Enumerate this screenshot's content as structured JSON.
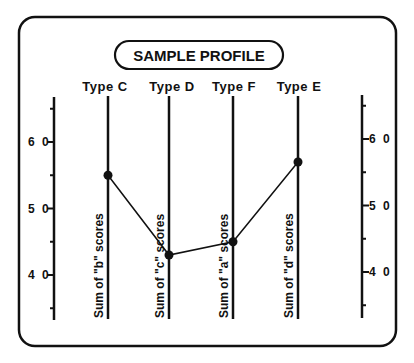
{
  "title": "SAMPLE PROFILE",
  "chart_data": {
    "type": "line",
    "title": "SAMPLE PROFILE",
    "categories": [
      "Type C",
      "Type D",
      "Type F",
      "Type E"
    ],
    "axis_labels": [
      "Sum of \"b\" scores",
      "Sum of \"c\" scores",
      "Sum of \"a\" scores",
      "Sum of \"d\" scores"
    ],
    "values": [
      55,
      43,
      45,
      57
    ],
    "ylim": [
      35,
      65
    ],
    "left_ticks": [
      "6 0",
      "5 0",
      "4 0"
    ],
    "right_ticks": [
      "6 0",
      "5 0",
      "4 0"
    ],
    "tick_values": [
      60,
      50,
      40
    ],
    "minor_tick_step": 5,
    "xlabel": "",
    "ylabel": "",
    "grid": false,
    "legend": "none"
  },
  "colors": {
    "ink": "#111111",
    "background": "#ffffff"
  }
}
